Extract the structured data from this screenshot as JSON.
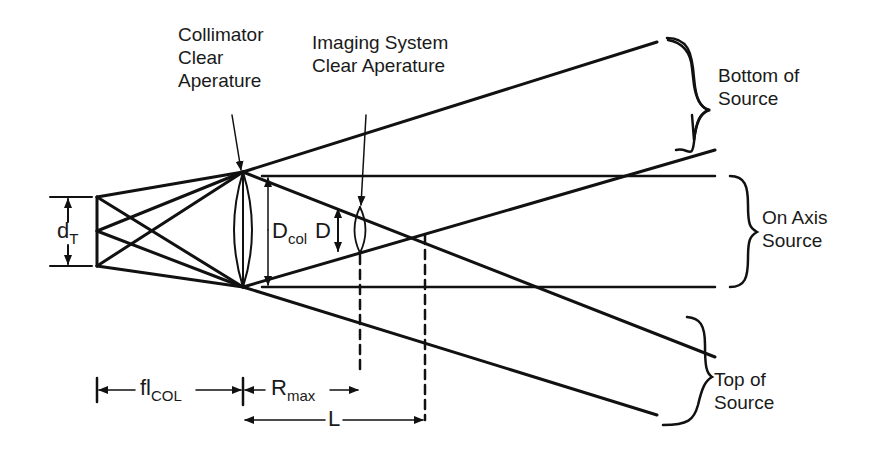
{
  "diagram": {
    "title": "",
    "labels": {
      "collimator": [
        "Collimator",
        "Clear",
        "Aperature"
      ],
      "imaging_system": [
        "Imaging System",
        "Clear Aperature"
      ],
      "bottom_of_source": [
        "Bottom of",
        "Source"
      ],
      "on_axis_source": [
        "On Axis",
        "Source"
      ],
      "top_of_source": [
        "Top of",
        "Source"
      ]
    },
    "symbols": {
      "dT": {
        "main": "d",
        "sub": "T"
      },
      "Dcol": {
        "main": "D",
        "sub": "col"
      },
      "D": {
        "main": "D"
      },
      "flCOL": {
        "main": "fl",
        "sub": "COL"
      },
      "Rmax": {
        "main": "R",
        "sub": "max"
      },
      "L": {
        "main": "L"
      }
    },
    "line_color": "#111111",
    "background": "#ffffff"
  }
}
